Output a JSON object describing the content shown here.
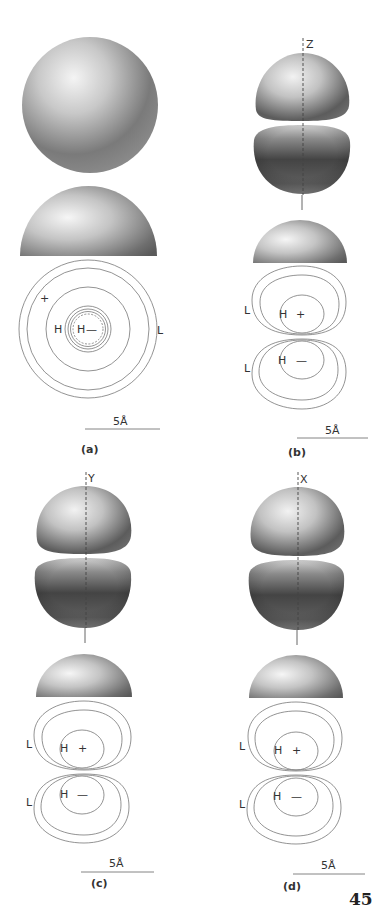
{
  "page": {
    "page_number": "45"
  },
  "panels": [
    {
      "id": "a",
      "caption": "(a)",
      "axis_label": "",
      "contour_labels": {
        "plus": "+",
        "h_outer": "H",
        "h_inner": "H",
        "minus": "—",
        "l": "L"
      },
      "scale_bar": "5Å"
    },
    {
      "id": "b",
      "caption": "(b)",
      "axis_label": "Z",
      "contour_labels": {
        "l_top": "L",
        "h_top": "H",
        "plus": "+",
        "l_bottom": "L",
        "h_bottom": "H",
        "minus": "—"
      },
      "scale_bar": "5Å"
    },
    {
      "id": "c",
      "caption": "(c)",
      "axis_label": "Y",
      "contour_labels": {
        "l_top": "L",
        "h_top": "H",
        "plus": "+",
        "l_bottom": "L",
        "h_bottom": "H",
        "minus": "—"
      },
      "scale_bar": "5Å"
    },
    {
      "id": "d",
      "caption": "(d)",
      "axis_label": "X",
      "contour_labels": {
        "l_top": "L",
        "h_top": "H",
        "plus": "+",
        "l_bottom": "L",
        "h_bottom": "H",
        "minus": "—"
      },
      "scale_bar": "5Å"
    }
  ],
  "colors": {
    "background": "#ffffff",
    "shade_light": "#f2f2f2",
    "shade_mid": "#9a9a9a",
    "shade_dark": "#3c3c3c",
    "contour": "#777777"
  }
}
